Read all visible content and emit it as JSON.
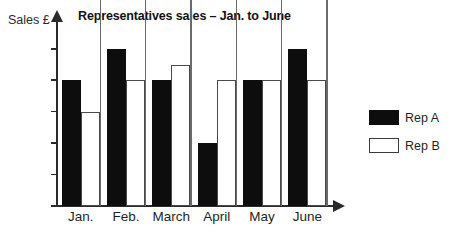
{
  "chart_data": {
    "type": "bar",
    "title": "Representatives sales – Jan. to June",
    "xlabel": "",
    "ylabel": "Sales £",
    "categories": [
      "Jan.",
      "Feb.",
      "March",
      "April",
      "May",
      "June"
    ],
    "series": [
      {
        "name": "Rep A",
        "values": [
          4000,
          5000,
          4000,
          2000,
          4000,
          5000
        ],
        "color": "#0d0d0d",
        "fill": "solid"
      },
      {
        "name": "Rep B",
        "values": [
          3000,
          4000,
          4500,
          4000,
          4000,
          4000
        ],
        "color": "#ffffff",
        "fill": "hollow"
      }
    ],
    "ylim": [
      0,
      5000
    ],
    "yticks": [
      "0",
      "1000",
      "2000",
      "3000",
      "4000",
      "5000"
    ],
    "ytick_values": [
      0,
      1000,
      2000,
      3000,
      4000,
      5000
    ],
    "grid": false,
    "legend_position": "right",
    "axis_style": "arrow-headed",
    "background": "#ffffff"
  },
  "legend": {
    "entries": [
      {
        "label": "Rep A"
      },
      {
        "label": "Rep B"
      }
    ]
  }
}
